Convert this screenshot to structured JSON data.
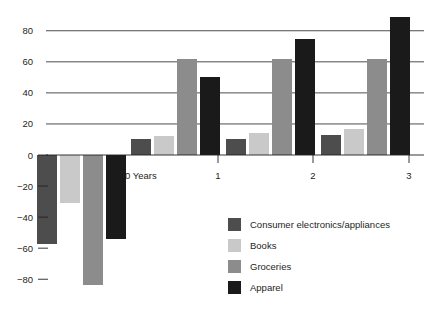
{
  "chart_data": {
    "type": "bar",
    "title": "",
    "subtitle": "",
    "xlabel": "Years",
    "ylabel": "",
    "categories": [
      "0",
      "1",
      "2",
      "3"
    ],
    "xtick_labels": [
      "0 Years",
      "1",
      "2",
      "3"
    ],
    "ytick_labels": [
      "80",
      "60",
      "40",
      "20",
      "0",
      "-20",
      "-40",
      "-60",
      "-80"
    ],
    "ytick_values": [
      80,
      60,
      40,
      20,
      0,
      -20,
      -40,
      -60,
      -80
    ],
    "ylim": [
      -92,
      92
    ],
    "grid": "horizontal-positive-only",
    "legend_position": "bottom-right",
    "series": [
      {
        "name": "Consumer electronics/appliances",
        "color": "#4d4d4d",
        "values": [
          -57,
          10,
          10,
          13
        ]
      },
      {
        "name": "Books",
        "color": "#c9c9c9",
        "values": [
          -31,
          12,
          14,
          17
        ]
      },
      {
        "name": "Groceries",
        "color": "#8c8c8c",
        "values": [
          -84,
          62,
          62,
          62
        ]
      },
      {
        "name": "Apparel",
        "color": "#1a1a1a",
        "values": [
          -54,
          50,
          75,
          89
        ]
      }
    ]
  },
  "legend": {
    "items": [
      {
        "label": "Consumer electronics/appliances",
        "color": "#4d4d4d"
      },
      {
        "label": "Books",
        "color": "#c9c9c9"
      },
      {
        "label": "Groceries",
        "color": "#8c8c8c"
      },
      {
        "label": "Apparel",
        "color": "#1a1a1a"
      }
    ]
  },
  "axis": {
    "x_title": "0 Years"
  }
}
